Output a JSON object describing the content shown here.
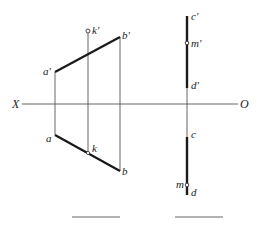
{
  "diagram": {
    "type": "orthographic-projection",
    "axis": {
      "left_label": "X",
      "right_label": "O"
    },
    "line_ab": {
      "front_view": {
        "start_label": "a'",
        "end_label": "b'",
        "point_label": "k'"
      },
      "top_view": {
        "start_label": "a",
        "end_label": "b",
        "point_label": "k"
      }
    },
    "line_cd": {
      "front_view": {
        "start_label": "c'",
        "end_label": "d'",
        "point_label": "m'"
      },
      "top_view": {
        "start_label": "c",
        "end_label": "d",
        "point_label": "m"
      }
    },
    "answer_blanks": [
      "",
      ""
    ],
    "colors": {
      "line": "#1a1a1a",
      "thin_line": "#555555",
      "background": "#ffffff"
    }
  }
}
